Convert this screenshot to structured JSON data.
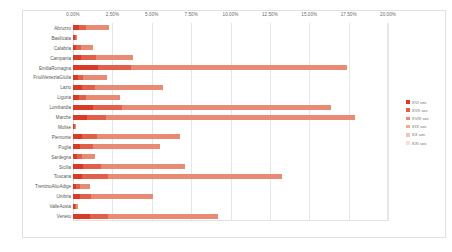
{
  "chart_data": {
    "type": "bar",
    "orientation": "horizontal",
    "stacked": true,
    "title": "",
    "xlabel": "",
    "ylabel": "",
    "xlim": [
      0,
      20
    ],
    "grid": true,
    "legend_position": "right",
    "xticks": [
      "0.00%",
      "2.50%",
      "5.00%",
      "7.50%",
      "10.00%",
      "12.50%",
      "15.00%",
      "17.50%",
      "20.00%"
    ],
    "xtick_values": [
      0,
      2.5,
      5,
      7.5,
      10,
      12.5,
      15,
      17.5,
      20
    ],
    "categories": [
      "Abruzzo",
      "Basilicata",
      "Calabria",
      "Campania",
      "EmiliaRomagna",
      "FriuliVeneziaGiulia",
      "Lazio",
      "Liguria",
      "Lombardia",
      "Marche",
      "Molise",
      "Piemonte",
      "Puglia",
      "Sardegna",
      "Sicilia",
      "Toscana",
      "TrentinoAltoAdige",
      "Umbria",
      "ValleAosta",
      "Veneto"
    ],
    "series": [
      {
        "name": "XVI sec",
        "color": "#d93a26",
        "values": [
          0.1,
          0.05,
          0.1,
          0.35,
          1.55,
          0.2,
          0.55,
          0.2,
          1.35,
          0.75,
          0.03,
          0.3,
          0.3,
          0.12,
          0.45,
          0.45,
          0.12,
          0.35,
          0.05,
          0.95
        ]
      },
      {
        "name": "XVII sec",
        "color": "#e0604a",
        "values": [
          0.35,
          0.05,
          0.2,
          0.7,
          0.9,
          0.35,
          0.85,
          0.5,
          0.85,
          0.85,
          0.03,
          0.95,
          0.7,
          0.25,
          1.15,
          1.45,
          0.2,
          0.6,
          0.08,
          0.95
        ]
      },
      {
        "name": "XVIII sec",
        "color": "#e88b75",
        "values": [
          0.8,
          0.05,
          0.55,
          1.35,
          3.0,
          0.75,
          1.45,
          0.8,
          2.35,
          2.55,
          0.05,
          2.3,
          1.8,
          0.55,
          2.25,
          3.1,
          0.4,
          1.6,
          0.12,
          2.05
        ]
      },
      {
        "name": "XIX sec",
        "color": "#efaa97"
      },
      {
        "name": "XX sec",
        "color": "#f3c4b6"
      },
      {
        "name": "XXI sec",
        "color": "#f8ded6"
      }
    ],
    "totals": [
      2.3,
      0.25,
      1.25,
      3.8,
      17.4,
      2.15,
      5.7,
      3.0,
      16.35,
      17.9,
      0.2,
      6.8,
      5.55,
      1.4,
      7.1,
      13.3,
      1.05,
      5.1,
      0.35,
      9.2
    ],
    "bars": [
      {
        "category": "Abruzzo",
        "segments": [
          0.4,
          0.45,
          1.45
        ]
      },
      {
        "category": "Basilicata",
        "segments": [
          0.12,
          0.06,
          0.07
        ]
      },
      {
        "category": "Calabria",
        "segments": [
          0.22,
          0.28,
          0.75
        ]
      },
      {
        "category": "Campania",
        "segments": [
          0.48,
          0.95,
          2.37
        ]
      },
      {
        "category": "EmiliaRomagna",
        "segments": [
          1.6,
          2.1,
          13.7
        ]
      },
      {
        "category": "FriuliVeneziaGiulia",
        "segments": [
          0.3,
          0.35,
          1.5
        ]
      },
      {
        "category": "Lazio",
        "segments": [
          0.6,
          0.8,
          4.3
        ]
      },
      {
        "category": "Liguria",
        "segments": [
          0.35,
          0.5,
          2.15
        ]
      },
      {
        "category": "Lombardia",
        "segments": [
          1.3,
          1.8,
          13.25
        ]
      },
      {
        "category": "Marche",
        "segments": [
          0.9,
          1.2,
          15.8
        ]
      },
      {
        "category": "Molise",
        "segments": [
          0.08,
          0.06,
          0.06
        ]
      },
      {
        "category": "Piemonte",
        "segments": [
          0.55,
          1.0,
          5.25
        ]
      },
      {
        "category": "Puglia",
        "segments": [
          0.45,
          0.85,
          4.25
        ]
      },
      {
        "category": "Sardegna",
        "segments": [
          0.25,
          0.3,
          0.85
        ]
      },
      {
        "category": "Sicilia",
        "segments": [
          0.65,
          1.15,
          5.3
        ]
      },
      {
        "category": "Toscana",
        "segments": [
          0.6,
          1.6,
          11.1
        ]
      },
      {
        "category": "TrentinoAltoAdige",
        "segments": [
          0.2,
          0.25,
          0.6
        ]
      },
      {
        "category": "Umbria",
        "segments": [
          0.45,
          0.7,
          3.95
        ]
      },
      {
        "category": "ValleAosta",
        "segments": [
          0.1,
          0.1,
          0.15
        ]
      },
      {
        "category": "Veneto",
        "segments": [
          1.05,
          1.2,
          6.95
        ]
      }
    ]
  },
  "legend": {
    "items": [
      {
        "label": "XVI sec",
        "color": "#d93a26"
      },
      {
        "label": "XVII sec",
        "color": "#e0604a"
      },
      {
        "label": "XVIII sec",
        "color": "#e88b75"
      },
      {
        "label": "XIX sec",
        "color": "#efaa97"
      },
      {
        "label": "XX sec",
        "color": "#f3c4b6"
      },
      {
        "label": "XXI sec",
        "color": "#f8ded6"
      }
    ]
  }
}
